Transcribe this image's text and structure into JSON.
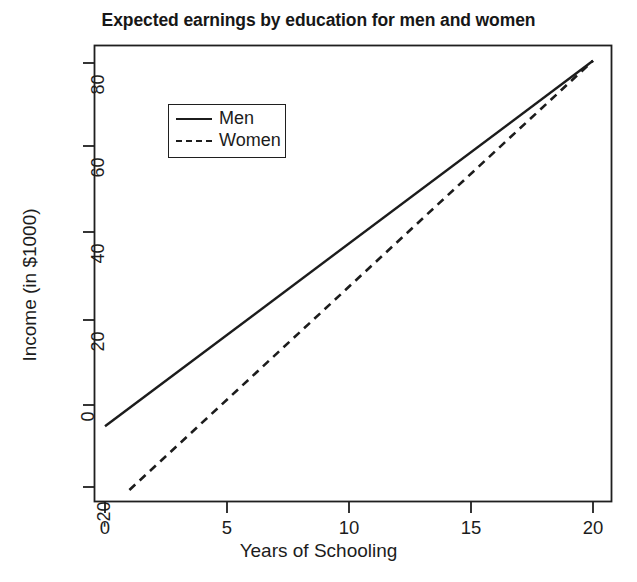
{
  "chart_data": {
    "type": "line",
    "title": "Expected earnings by education for men and women",
    "xlabel": "Years of Schooling",
    "ylabel": "Income (in $1000)",
    "xlim": [
      -1.2,
      21.5
    ],
    "ylim": [
      -26,
      86
    ],
    "xticks": [
      0,
      5,
      10,
      15,
      20
    ],
    "xticklabels": [
      "0",
      "5",
      "10",
      "15",
      "20"
    ],
    "yticks": [
      -20,
      0,
      20,
      40,
      60,
      80
    ],
    "yticklabels": [
      "-20",
      "0",
      "20",
      "40",
      "60",
      "80"
    ],
    "grid": false,
    "legend_position": "upper left",
    "series": [
      {
        "name": "Men",
        "linestyle": "solid",
        "color": "#1c1c1c",
        "x": [
          0,
          20
        ],
        "values": [
          -5,
          81
        ],
        "intercept": -5,
        "slope": 4.3
      },
      {
        "name": "Women",
        "linestyle": "dashed",
        "color": "#1c1c1c",
        "x": [
          1,
          20
        ],
        "values": [
          -20,
          81
        ],
        "intercept": -25.3,
        "slope": 5.3
      }
    ]
  },
  "legend": {
    "items": [
      {
        "label": "Men"
      },
      {
        "label": "Women"
      }
    ]
  }
}
